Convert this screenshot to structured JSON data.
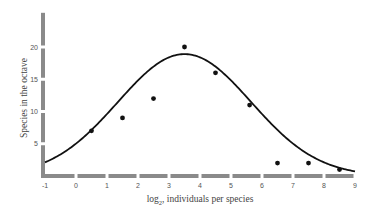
{
  "chart_data": {
    "type": "scatter",
    "title": "",
    "xlabel": "log2, individuals per species",
    "xlabel_main": "log",
    "xlabel_sub": "2",
    "xlabel_rest": ", individuals per species",
    "ylabel": "Species in the octave",
    "xlim": [
      -1,
      9
    ],
    "ylim": [
      0,
      25
    ],
    "x_ticks": [
      -1,
      0,
      1,
      2,
      3,
      4,
      5,
      6,
      7,
      8,
      9
    ],
    "y_ticks": [
      5,
      10,
      15,
      20
    ],
    "grid": false,
    "legend": null,
    "series": [
      {
        "name": "observed species per octave",
        "kind": "points",
        "x": [
          0.5,
          1.5,
          2.5,
          3.5,
          4.5,
          5.6,
          6.5,
          7.5,
          8.5
        ],
        "y": [
          7,
          9,
          12,
          20,
          16,
          11,
          2,
          2,
          1
        ]
      },
      {
        "name": "fitted lognormal curve",
        "kind": "line",
        "peak_x": 3.5,
        "peak_y": 18.9,
        "sigma": 2.15,
        "x_range": [
          -1,
          9
        ]
      }
    ]
  },
  "colors": {
    "axis": "#8a8a8a",
    "points": "#111111",
    "curve": "#111111",
    "text": "#555555"
  }
}
